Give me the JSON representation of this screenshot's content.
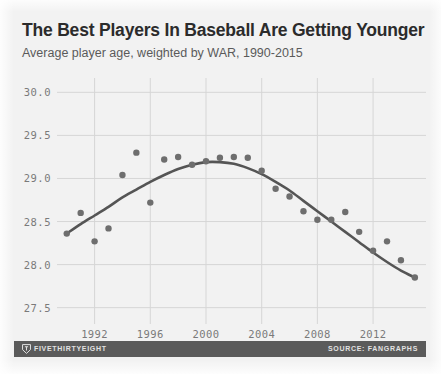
{
  "header": {
    "title": "The Best Players In Baseball Are Getting Younger",
    "subtitle": "Average player age, weighted by WAR, 1990-2015"
  },
  "footer": {
    "brand": "FIVETHIRTYEIGHT",
    "source": "SOURCE: FANGRAPHS",
    "logo_icon": "fivethirtyeight-shield-icon",
    "bar_color": "#5b5b5b"
  },
  "style": {
    "background": "#f2f2f2",
    "grid_color": "#d6d6d6",
    "marker_color": "#6e6e6e",
    "trend_color": "#555555",
    "title_color": "#2b2b2b",
    "subtitle_color": "#5a5a5a",
    "tick_color": "#7a7a7a"
  },
  "chart_data": {
    "type": "scatter",
    "title": "The Best Players In Baseball Are Getting Younger",
    "subtitle": "Average player age, weighted by WAR, 1990-2015",
    "xlabel": "",
    "ylabel": "",
    "xlim": [
      1989.3,
      2015.8
    ],
    "ylim": [
      27.38,
      30.12
    ],
    "grid": true,
    "legend": null,
    "x_ticks": [
      1992,
      1996,
      2000,
      2004,
      2008,
      2012
    ],
    "x_tick_labels": [
      "1992",
      "1996",
      "2000",
      "2004",
      "2008",
      "2012"
    ],
    "y_ticks": [
      27.5,
      28.0,
      28.5,
      29.0,
      29.5,
      30.0
    ],
    "y_tick_labels": [
      "27.5",
      "28.0",
      "28.5",
      "29.0",
      "29.5",
      "30.0"
    ],
    "x": [
      1990,
      1991,
      1992,
      1993,
      1994,
      1995,
      1996,
      1997,
      1998,
      1999,
      2000,
      2001,
      2002,
      2003,
      2004,
      2005,
      2006,
      2007,
      2008,
      2009,
      2010,
      2011,
      2012,
      2013,
      2014,
      2015
    ],
    "values": [
      28.36,
      28.6,
      28.27,
      28.42,
      29.04,
      29.3,
      28.72,
      29.22,
      29.25,
      29.16,
      29.2,
      29.24,
      29.25,
      29.24,
      29.09,
      28.88,
      28.79,
      28.62,
      28.52,
      28.52,
      28.61,
      28.38,
      28.16,
      28.27,
      28.05,
      27.85
    ],
    "series": [
      {
        "name": "Average player age, weighted by WAR",
        "marker": "circle",
        "values": [
          28.36,
          28.6,
          28.27,
          28.42,
          29.04,
          29.3,
          28.72,
          29.22,
          29.25,
          29.16,
          29.2,
          29.24,
          29.25,
          29.24,
          29.09,
          28.88,
          28.79,
          28.62,
          28.52,
          28.52,
          28.61,
          28.38,
          28.16,
          28.27,
          28.05,
          27.85
        ]
      }
    ],
    "trend": {
      "name": "smoothed trend",
      "x": [
        1990,
        1991,
        1992,
        1993,
        1994,
        1995,
        1996,
        1997,
        1998,
        1999,
        2000,
        2001,
        2002,
        2003,
        2004,
        2005,
        2006,
        2007,
        2008,
        2009,
        2010,
        2011,
        2012,
        2013,
        2014,
        2015
      ],
      "values": [
        28.36,
        28.47,
        28.57,
        28.67,
        28.78,
        28.87,
        28.96,
        29.04,
        29.11,
        29.16,
        29.19,
        29.19,
        29.17,
        29.12,
        29.05,
        28.96,
        28.86,
        28.74,
        28.62,
        28.5,
        28.38,
        28.26,
        28.14,
        28.03,
        27.93,
        27.85
      ]
    }
  }
}
